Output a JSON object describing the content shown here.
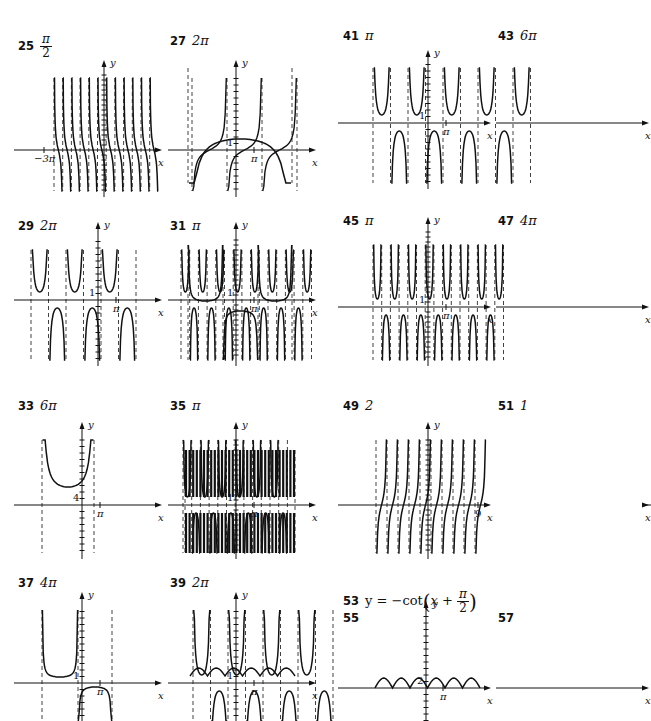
{
  "page": {
    "width": 651,
    "height": 721
  },
  "answers": [
    {
      "id": "25",
      "num": "25",
      "answer_frac": {
        "num": "π",
        "den": "2"
      },
      "x": 18,
      "y": 33,
      "graph": {
        "type": "tan_neg",
        "x": 14,
        "y": 65,
        "w": 150,
        "h": 140,
        "ox": 90,
        "oy": 85,
        "periods": 12,
        "period_px": 8.7,
        "start_px": 40,
        "top": 13,
        "bottom": 126,
        "ylabel": "y",
        "xlabel": "x",
        "xtick_label": "−3π",
        "xtick_pos": -60,
        "dense_y": true
      }
    },
    {
      "id": "27",
      "num": "27",
      "answer": "2π",
      "x": 170,
      "y": 33,
      "graph": {
        "type": "tan_pos",
        "x": 168,
        "y": 65,
        "w": 150,
        "h": 140,
        "ox": 68,
        "oy": 85,
        "periods": 3,
        "period_px": 35,
        "start_px": 24,
        "top": 13,
        "bottom": 126,
        "ylabel": "y",
        "xlabel": "x",
        "ylabel_one": "1",
        "xtick_label": "π",
        "xtick_pos": 18
      }
    },
    {
      "id": "41",
      "num": "41",
      "answer": "π",
      "x": 343,
      "y": 28,
      "graph": {
        "type": "sec",
        "x": 338,
        "y": 58,
        "w": 155,
        "h": 140,
        "ox": 90,
        "oy": 65,
        "asym_px": 17.5,
        "n_asym": 10,
        "start_px": 35,
        "top": 10,
        "bottom": 125,
        "ylabel": "y",
        "xlabel": "x",
        "ylabel_one": "1",
        "xtick_label": "π",
        "xtick_pos": 18
      }
    },
    {
      "id": "43",
      "num": "43",
      "answer": "6π",
      "x": 498,
      "y": 28,
      "graph": {
        "type": "csc_wide",
        "x": 496,
        "y": 58,
        "w": 155,
        "h": 140,
        "ox": 242,
        "oy": 65,
        "asym": [
          188,
          292
        ],
        "top": 10,
        "bottom": 125,
        "ylabel": "y",
        "xlabel": "x",
        "ylabel_one": "1",
        "xtick_label": "π",
        "xtick_pos": 18
      }
    },
    {
      "id": "29",
      "num": "29",
      "answer": "2π",
      "x": 18,
      "y": 218,
      "graph": {
        "type": "sec",
        "x": 14,
        "y": 250,
        "w": 150,
        "h": 110,
        "ox": 84,
        "oy": 50,
        "asym_px": 17.5,
        "n_asym": 7,
        "start_px": 17,
        "top": -10,
        "bottom": 110,
        "ylabel": "y",
        "xlabel": "x",
        "ylabel_one": "1",
        "xtick_label": "π",
        "xtick_pos": 18,
        "mode": "wide"
      }
    },
    {
      "id": "31",
      "num": "31",
      "answer": "π",
      "x": 170,
      "y": 218,
      "graph": {
        "type": "sec",
        "x": 168,
        "y": 250,
        "w": 150,
        "h": 110,
        "ox": 68,
        "oy": 50,
        "asym_px": 8.7,
        "n_asym": 16,
        "start_px": 13,
        "top": -10,
        "bottom": 110,
        "ylabel": "y",
        "xlabel": "x",
        "ylabel_one": "1",
        "xtick_label": "π",
        "xtick_pos": 18,
        "dense_y": true
      }
    },
    {
      "id": "45",
      "num": "45",
      "answer": "π",
      "x": 343,
      "y": 213,
      "graph": {
        "type": "sec",
        "x": 338,
        "y": 245,
        "w": 155,
        "h": 115,
        "ox": 90,
        "oy": 62,
        "asym_px": 8.7,
        "n_asym": 16,
        "start_px": 35,
        "top": -10,
        "bottom": 115,
        "ylabel": "y",
        "xlabel": "x",
        "ylabel_one": "1",
        "xtick_label": "π",
        "xtick_pos": 18,
        "dense_y": true
      }
    },
    {
      "id": "47",
      "num": "47",
      "answer": "4π",
      "x": 498,
      "y": 213,
      "graph": {
        "type": "sec_flat",
        "x": 496,
        "y": 245,
        "w": 155,
        "h": 115,
        "ox": 242,
        "oy": 62,
        "asym": [
          188,
          223,
          258,
          292
        ],
        "top": -10,
        "bottom": 115,
        "ylabel": "y",
        "xlabel": "x",
        "ylabel_one": "1",
        "xtick_label": "π",
        "xtick_pos": 18
      }
    },
    {
      "id": "33",
      "num": "33",
      "answer": "6π",
      "x": 18,
      "y": 398,
      "graph": {
        "type": "sec_wide",
        "x": 14,
        "y": 430,
        "w": 150,
        "h": 130,
        "ox": 68,
        "oy": 75,
        "asym": [
          42,
          94
        ],
        "top": 10,
        "bottom": 123,
        "ylabel": "y",
        "xlabel": "x",
        "ylabel_one": "4",
        "xtick_label": "π",
        "xtick_pos": 18
      }
    },
    {
      "id": "35",
      "num": "35",
      "answer": "π",
      "x": 170,
      "y": 398,
      "graph": {
        "type": "sec",
        "x": 168,
        "y": 430,
        "w": 150,
        "h": 130,
        "ox": 68,
        "oy": 75,
        "asym_px": 8.7,
        "n_asym": 13,
        "start_px": 15,
        "top": 10,
        "bottom": 123,
        "ylabel": "y",
        "xlabel": "x",
        "ylabel_one": "1",
        "xtick_label": "π",
        "xtick_pos": 18,
        "dense_y": true
      }
    },
    {
      "id": "49",
      "num": "49",
      "answer": "2",
      "x": 343,
      "y": 398,
      "graph": {
        "type": "tan_pos_steep",
        "x": 338,
        "y": 430,
        "w": 155,
        "h": 130,
        "ox": 90,
        "oy": 75,
        "periods": 10,
        "period_px": 11,
        "start_px": 38,
        "top": 10,
        "bottom": 123,
        "ylabel": "y",
        "xlabel": "x",
        "xtick_label": "9",
        "xtick_pos": 50,
        "dense_y": true
      }
    },
    {
      "id": "51",
      "num": "51",
      "answer": "1",
      "x": 498,
      "y": 398,
      "graph": {
        "type": "dense",
        "x": 496,
        "y": 430,
        "w": 155,
        "h": 130,
        "ox": 240,
        "oy": 75,
        "left": 185,
        "right": 295,
        "top": 20,
        "bottom": 123,
        "ylabel": "y",
        "xlabel": "x",
        "ylabel_one": "1",
        "xtick_label": "1",
        "xtick_pos": 6
      }
    },
    {
      "id": "37",
      "num": "37",
      "answer": "4π",
      "x": 18,
      "y": 575,
      "graph": {
        "type": "sec_flat",
        "x": 14,
        "y": 600,
        "w": 150,
        "h": 121,
        "ox": 68,
        "oy": 83,
        "asym": [
          42,
          78,
          112
        ],
        "top": 10,
        "bottom": 121,
        "ylabel": "y",
        "xlabel": "x",
        "ylabel_one": "1",
        "xtick_label": "π",
        "xtick_pos": 18
      }
    },
    {
      "id": "39",
      "num": "39",
      "answer": "2π",
      "x": 170,
      "y": 575,
      "graph": {
        "type": "sec",
        "x": 168,
        "y": 600,
        "w": 150,
        "h": 121,
        "ox": 68,
        "oy": 83,
        "asym_px": 17.5,
        "n_asym": 9,
        "start_px": 25,
        "top": 10,
        "bottom": 121,
        "ylabel": "y",
        "xlabel": "x",
        "ylabel_one": "1",
        "xtick_label": "π",
        "xtick_pos": 18
      }
    }
  ],
  "eq53": {
    "num": "53",
    "text_prefix": "y = −cot",
    "paren_left": "(",
    "x_var": "x + ",
    "frac_num": "π",
    "frac_den": "2",
    "paren_right": ")",
    "x": 343,
    "y": 588
  },
  "plain": [
    {
      "id": "55",
      "num": "55",
      "x": 343,
      "y": 610,
      "graph": {
        "type": "bumps",
        "x": 338,
        "y": 613,
        "w": 155,
        "h": 108,
        "ox": 88,
        "oy": 75,
        "amp": 10,
        "base": 0,
        "period_px": 17.5,
        "n": 6,
        "start_px": 37,
        "top": 6,
        "bottom": 108,
        "ylabel": "y",
        "xlabel": "x",
        "ylabel_one": "2",
        "xtick_label": "π",
        "xtick_pos": 17
      }
    },
    {
      "id": "57",
      "num": "57",
      "x": 498,
      "y": 610,
      "graph": {
        "type": "bumps",
        "x": 496,
        "y": 613,
        "w": 155,
        "h": 108,
        "ox": 240,
        "oy": 75,
        "amp": 8,
        "base": 12,
        "period_px": 17.5,
        "n": 6,
        "start_px": 190,
        "top": 6,
        "bottom": 108,
        "ylabel": "y",
        "xlabel": "x",
        "ylabel_one": "1",
        "xtick_label": "π",
        "xtick_pos": 17
      }
    }
  ]
}
